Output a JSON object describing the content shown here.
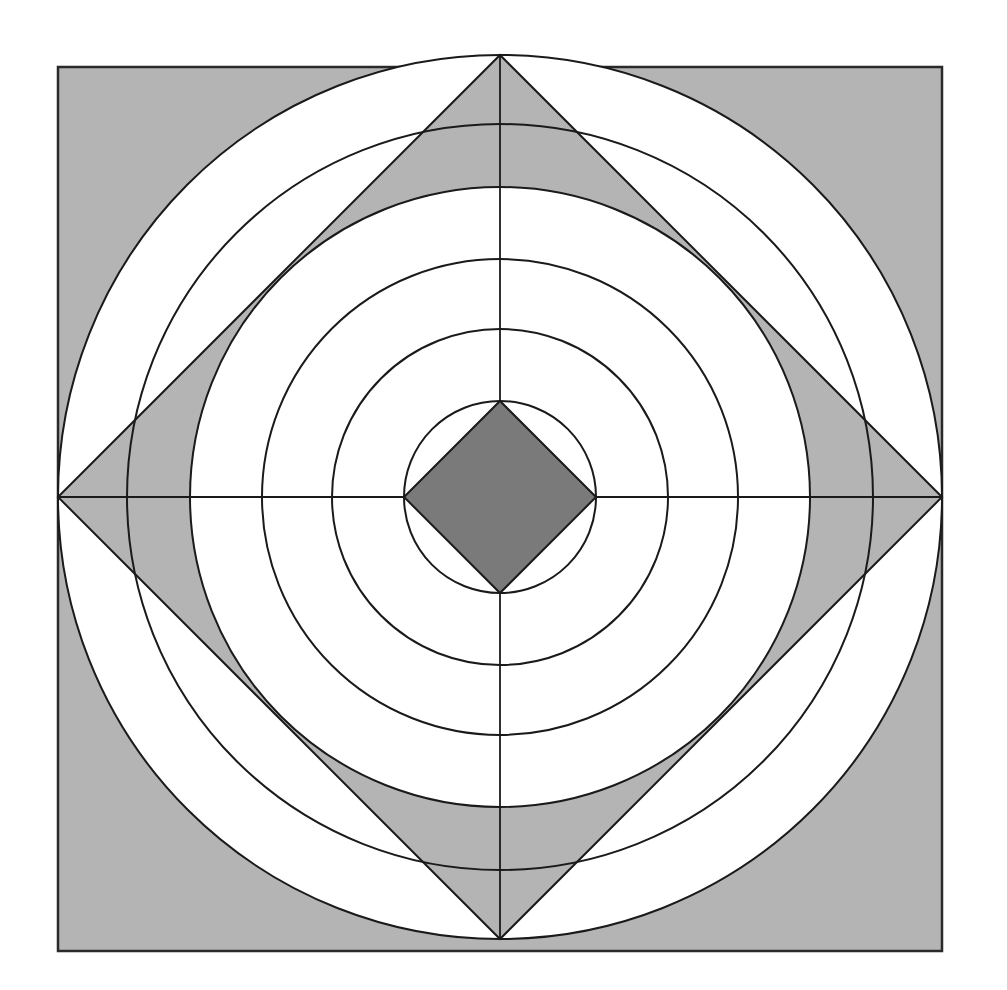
{
  "figure": {
    "title": "",
    "colors": {
      "background": "#ffffff",
      "light_fill": "#b4b4b4",
      "dark_fill": "#7a7a7a",
      "stroke": "#1a1a1a"
    },
    "square": {
      "x": 58,
      "y": 67,
      "size": 884
    },
    "center": {
      "cx": 500,
      "cy": 497
    },
    "circles": [
      {
        "name": "circle-1",
        "r": 96
      },
      {
        "name": "circle-2",
        "r": 168
      },
      {
        "name": "circle-3",
        "r": 238
      },
      {
        "name": "circle-4",
        "r": 310
      },
      {
        "name": "circle-5",
        "r": 373
      },
      {
        "name": "circle-outer",
        "r": 442
      }
    ],
    "outer_diamond": {
      "half_diagonal": 442
    },
    "inner_diamond": {
      "half_diagonal": 96
    },
    "axes": {
      "horizontal": true,
      "vertical": true
    }
  }
}
